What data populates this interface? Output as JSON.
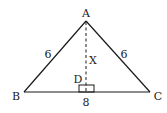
{
  "diagram": {
    "type": "isosceles-triangle-with-altitude",
    "colors": {
      "stroke": "#1a1a1a",
      "background": "#ffffff"
    },
    "vertices": {
      "A": {
        "label": "A"
      },
      "B": {
        "label": "B"
      },
      "C": {
        "label": "C"
      },
      "D": {
        "label": "D"
      }
    },
    "sides": {
      "AB": {
        "label": "6"
      },
      "AC": {
        "label": "6"
      },
      "BC": {
        "label": "8"
      }
    },
    "altitude": {
      "label": "X",
      "style": "dashed",
      "right_angle_marker": true
    }
  }
}
